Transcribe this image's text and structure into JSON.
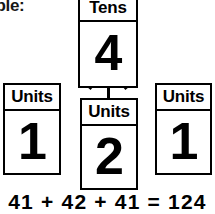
{
  "page": {
    "background_color": "#ffffff",
    "line_color": "#000000",
    "partial_caption": "iple:"
  },
  "diagram": {
    "type": "place-value-partition",
    "root": {
      "label": "Tens",
      "digit": "4"
    },
    "children": [
      {
        "label": "Units",
        "digit": "1",
        "position": "left"
      },
      {
        "label": "Units",
        "digit": "2",
        "position": "middle"
      },
      {
        "label": "Units",
        "digit": "1",
        "position": "right"
      }
    ]
  },
  "equation": {
    "text": "41 + 42 + 41 = 124",
    "addends": [
      41,
      42,
      41
    ],
    "total": 124
  }
}
